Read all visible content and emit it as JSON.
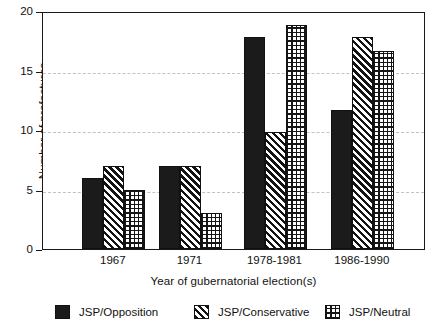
{
  "chart_data": {
    "type": "bar",
    "title": "",
    "subtitle": "",
    "xlabel": "Year of gubernatorial election(s)",
    "ylabel": "Number of prefectures",
    "categories": [
      "1967",
      "1971",
      "1978-1981",
      "1986-1990"
    ],
    "series": [
      {
        "name": "JSP/Opposition",
        "pattern": "solid-black",
        "values": [
          6,
          7,
          17.8,
          11.7
        ]
      },
      {
        "name": "JSP/Conservative",
        "pattern": "diagonal-hatch",
        "values": [
          7,
          7,
          9.8,
          17.8
        ]
      },
      {
        "name": "JSP/Neutral",
        "pattern": "cross-hatch",
        "values": [
          5,
          3,
          18.8,
          16.6
        ]
      }
    ],
    "ylim": [
      0,
      20
    ],
    "yticks": [
      0,
      5,
      10,
      15,
      20
    ],
    "ytick_labels": [
      "0",
      "5",
      "10",
      "15",
      "20"
    ],
    "gridlines": [
      5,
      10,
      15
    ],
    "grid": true,
    "grid_style": "dashed",
    "grid_color": "#c2c2c2",
    "legend_position": "bottom",
    "axis_color": "#1a1a1a",
    "background": "#ffffff"
  },
  "legend": {
    "items": [
      {
        "label": "JSP/Opposition"
      },
      {
        "label": "JSP/Conservative"
      },
      {
        "label": "JSP/Neutral"
      }
    ]
  }
}
